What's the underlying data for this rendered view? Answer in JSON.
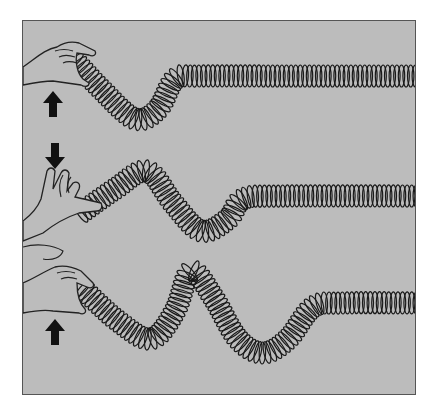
{
  "figure": {
    "title": "Slinky wave demonstration",
    "colors": {
      "background": "#bcbcbc",
      "frame_border": "#555555",
      "coil_stroke": "#1a1a1a",
      "hand_fill": "#bcbcbc",
      "hand_stroke": "#222222",
      "arrow_fill": "#111111"
    },
    "panels": [
      {
        "id": "panel-1",
        "hand_motion": "up",
        "arrow_icon": "arrow-up-icon",
        "wave": "single trough near hand"
      },
      {
        "id": "panel-2",
        "hand_motion": "down",
        "arrow_icon": "arrow-down-icon",
        "wave": "crest then trough"
      },
      {
        "id": "panel-3",
        "hand_motion": "up",
        "arrow_icon": "arrow-up-icon",
        "wave": "trough, crest, trough"
      }
    ]
  }
}
